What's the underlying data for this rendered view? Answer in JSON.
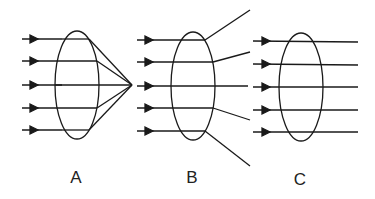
{
  "diagram": {
    "stroke_color": "#1a1a1a",
    "panels": [
      {
        "label": "A",
        "type": "converging",
        "ellipse": {
          "cx": 77,
          "cy": 85,
          "rx": 22,
          "ry": 54
        },
        "ray_y": [
          39,
          61,
          85,
          108,
          130
        ],
        "ray_start_x": 22,
        "arrow_x": 37,
        "focal_point": {
          "x": 132,
          "y": 85
        }
      },
      {
        "label": "B",
        "type": "diverging",
        "ellipse": {
          "cx": 193,
          "cy": 86,
          "rx": 22,
          "ry": 54
        },
        "ray_y": [
          40,
          62,
          86,
          108,
          131
        ],
        "ray_start_x": 137,
        "arrow_x": 152
      },
      {
        "label": "C",
        "type": "parallel",
        "ellipse": {
          "cx": 301,
          "cy": 87,
          "rx": 22,
          "ry": 54
        },
        "ray_y": [
          41,
          64,
          87,
          110,
          132
        ],
        "ray_start_x": 253,
        "arrow_x": 268,
        "ray_end_x": 358
      }
    ]
  }
}
